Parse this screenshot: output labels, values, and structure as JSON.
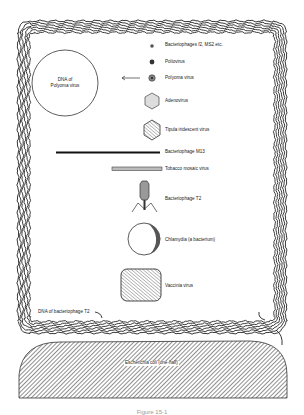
{
  "figure": {
    "caption": "Figure 15-1",
    "items": [
      {
        "id": "ms2",
        "label": "Bacteriophages f2, MS2 etc."
      },
      {
        "id": "polio",
        "label": "Poliovirus"
      },
      {
        "id": "polyoma",
        "label": "Polyoma virus"
      },
      {
        "id": "adeno",
        "label": "Adenovirus"
      },
      {
        "id": "tipula",
        "label": "Tipula iridescent virus"
      },
      {
        "id": "m13",
        "label": "Bacteriophage M13"
      },
      {
        "id": "tmv",
        "label": "Tobacco mosaic virus"
      },
      {
        "id": "t2",
        "label": "Bacteriophage T2"
      },
      {
        "id": "chlamydia",
        "label": "Chlamydia (a bacterium)"
      },
      {
        "id": "vaccinia",
        "label": "Vaccinia virus"
      }
    ],
    "dna_polyoma_label_line1": "DNA of",
    "dna_polyoma_label_line2": "Polyoma virus",
    "dna_t2_label": "DNA of bacteriophage T2",
    "ecoli_label": "Escherichia coli (one-half)"
  }
}
